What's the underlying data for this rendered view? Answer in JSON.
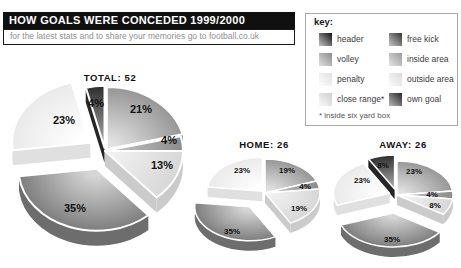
{
  "header": {
    "title": "HOW GOALS WERE CONCEDED 1999/2000",
    "tagline": "for the latest stats and to share your memories go to football.co.uk",
    "bar_bg": "#101010",
    "bar_text": "#ffffff",
    "tagline_color": "#8f8f8f"
  },
  "key": {
    "title": "key:",
    "footnote": "* inside six yard box",
    "items": [
      {
        "id": "header",
        "label": "header",
        "dark": "#1a1a1a",
        "light": "#b2b2b2"
      },
      {
        "id": "volley",
        "label": "volley",
        "dark": "#8f8f8f",
        "light": "#d8d8d8"
      },
      {
        "id": "penalty",
        "label": "penalty",
        "dark": "#e2e2e2",
        "light": "#fbfbfb"
      },
      {
        "id": "close-range",
        "label": "close range*",
        "dark": "#d0d0d0",
        "light": "#f6f6f6"
      },
      {
        "id": "free-kick",
        "label": "free kick",
        "dark": "#3c3c3c",
        "light": "#b8b8b8"
      },
      {
        "id": "inside-area",
        "label": "inside area",
        "dark": "#9c9c9c",
        "light": "#dedede"
      },
      {
        "id": "outside-area",
        "label": "outside area",
        "dark": "#dcdcdc",
        "light": "#f8f8f8"
      },
      {
        "id": "own-goal",
        "label": "own goal",
        "dark": "#2d2d2d",
        "light": "#aaaaaa"
      }
    ]
  },
  "chart_data": {
    "type": "pie",
    "style": "3d-exploded",
    "legend_position": "top-right",
    "categories": {
      "header": {
        "inner": "#e2e2e2",
        "outer": "#969696",
        "side": "#878787"
      },
      "volley": {
        "inner": "#c2c2c2",
        "outer": "#8c8c8c",
        "side": "#7c7c7c"
      },
      "penalty": {
        "inner": "#f1f1f1",
        "outer": "#d7d7d7",
        "side": "#cbcbcb"
      },
      "close_range": {
        "inner": "#d6d6d6",
        "outer": "#7e7e7e",
        "side": "#6d6d6d"
      },
      "outside_area": {
        "inner": "#ffffff",
        "outer": "#eaeaea",
        "side": "#e0e0e0"
      },
      "own_goal": {
        "inner": "#a0a0a0",
        "outer": "#2e2e2e",
        "side": "#262626"
      }
    },
    "charts": [
      {
        "id": "total",
        "title": "TOTAL: 52",
        "total_goals": 52,
        "title_x": 110,
        "title_y": 81,
        "cx": 105,
        "cy": 151,
        "rx": 78,
        "ry": 62,
        "depth": 15,
        "label_size": 11,
        "slices": [
          {
            "category": "header",
            "value": 11,
            "pct_label": "21%",
            "explode": 3,
            "label_dx": 36,
            "label_dy": -42
          },
          {
            "category": "volley",
            "value": 2,
            "pct_label": "4%",
            "explode": 0,
            "label_dx": 64,
            "label_dy": -11
          },
          {
            "category": "penalty",
            "value": 7,
            "pct_label": "13%",
            "explode": 0,
            "endFace": true,
            "label_dx": 57,
            "label_dy": 14
          },
          {
            "category": "close_range",
            "value": 18,
            "pct_label": "35%",
            "explode": 24,
            "label_dx": -30,
            "label_dy": 57
          },
          {
            "category": "outside_area",
            "value": 12,
            "pct_label": "23%",
            "explode": 18,
            "label_dx": -41,
            "label_dy": -31
          },
          {
            "category": "own_goal",
            "value": 2,
            "pct_label": "4%",
            "explode": 4,
            "label_dx": -9,
            "label_dy": -48
          }
        ]
      },
      {
        "id": "home",
        "title": "HOME: 26",
        "total_goals": 26,
        "title_x": 264,
        "title_y": 148,
        "cx": 265,
        "cy": 193,
        "rx": 55,
        "ry": 34,
        "depth": 10,
        "label_size": 8,
        "slices": [
          {
            "category": "header",
            "value": 5,
            "pct_label": "19%",
            "explode": 0,
            "label_dx": 22,
            "label_dy": -23
          },
          {
            "category": "volley",
            "value": 1,
            "pct_label": "4%",
            "explode": 0,
            "label_dx": 40,
            "label_dy": -7
          },
          {
            "category": "penalty",
            "value": 5,
            "pct_label": "19%",
            "explode": 0,
            "endFace": true,
            "label_dx": 34,
            "label_dy": 15
          },
          {
            "category": "close_range",
            "value": 9,
            "pct_label": "35%",
            "explode": 27,
            "label_dx": -33,
            "label_dy": 38
          },
          {
            "category": "outside_area",
            "value": 6,
            "pct_label": "23%",
            "explode": 4,
            "label_dx": -23,
            "label_dy": -23
          }
        ]
      },
      {
        "id": "away",
        "title": "AWAY: 26",
        "total_goals": 26,
        "title_x": 403,
        "title_y": 148,
        "cx": 397,
        "cy": 195,
        "rx": 56,
        "ry": 34,
        "depth": 10,
        "label_size": 8,
        "slices": [
          {
            "category": "header",
            "value": 6,
            "pct_label": "23%",
            "explode": 0,
            "label_dx": 17,
            "label_dy": -24
          },
          {
            "category": "volley",
            "value": 1,
            "pct_label": "4%",
            "explode": 0,
            "label_dx": 35,
            "label_dy": -1
          },
          {
            "category": "penalty",
            "value": 2,
            "pct_label": "8%",
            "explode": 0,
            "endFace": true,
            "label_dx": 38,
            "label_dy": 10
          },
          {
            "category": "close_range",
            "value": 9,
            "pct_label": "35%",
            "explode": 30,
            "label_dx": -5,
            "label_dy": 44
          },
          {
            "category": "outside_area",
            "value": 6,
            "pct_label": "23%",
            "explode": 8,
            "label_dx": -35,
            "label_dy": -15
          },
          {
            "category": "own_goal",
            "value": 2,
            "pct_label": "8%",
            "explode": 10,
            "label_dx": -14,
            "label_dy": -30
          }
        ]
      }
    ]
  }
}
